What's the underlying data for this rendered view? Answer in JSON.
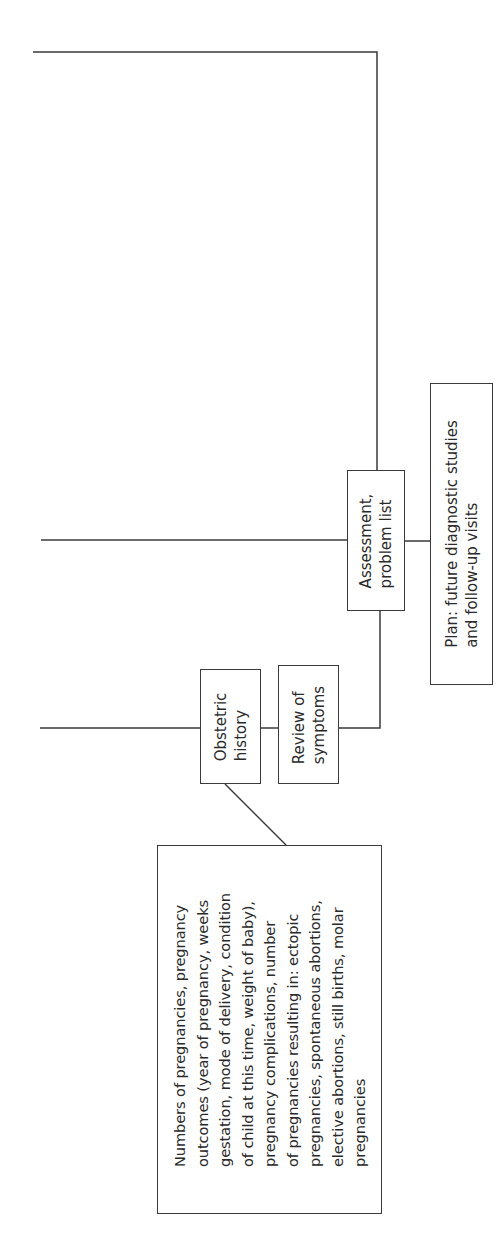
{
  "diagram": {
    "nodes": {
      "obstetric_history": {
        "lines": [
          "Obstetric",
          "history"
        ]
      },
      "review_of_symptoms": {
        "lines": [
          "Review of",
          "symptoms"
        ]
      },
      "assessment": {
        "lines": [
          "Assessment,",
          "problem list"
        ]
      },
      "plan": {
        "lines": [
          "Plan: future diagnostic studies",
          "and follow-up visits"
        ]
      },
      "obstetric_detail": {
        "lines": [
          "Numbers of pregnancies, pregnancy",
          "outcomes (year of pregnancy, weeks",
          "gestation, mode of delivery, condition",
          "of child at this time, weight of baby),",
          "pregnancy complications, number",
          "of pregnancies resulting in: ectopic",
          "pregnancies, spontaneous abortions,",
          "elective abortions, still births, molar",
          "pregnancies"
        ]
      }
    },
    "colors": {
      "line": "#3a3a3a",
      "background": "#ffffff"
    }
  }
}
